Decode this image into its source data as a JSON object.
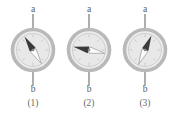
{
  "figure": {
    "background_color": "#ffffff",
    "width": 176,
    "height": 117
  },
  "style": {
    "ring_color": "#b9b9b9",
    "dial_face_color": "#e6e6e6",
    "dial_inner_ring_color": "#cfcfcf",
    "axis_line_color": "#9a9a9a",
    "needle_dark_color": "#3a3a3a",
    "needle_light_color": "#fbfbfb",
    "needle_light_stroke": "#9e9e9e",
    "pivot_color": "#8a8a8a",
    "text_color": "#5d5d5d",
    "caption_color": "#6a6a6a"
  },
  "panels": [
    {
      "id": "panel-1",
      "caption": "(1)",
      "axis_top_label": "a",
      "axis_bottom_label": "b",
      "center_x": 33,
      "center_y": 50,
      "outer_radius": 21,
      "inner_radius": 17,
      "needle_dark_bearing_deg": -32,
      "needle_light_bearing_deg": 148,
      "needle_dark_direction": "up-left (NNW)",
      "needle_light_direction": "down-right (SSE)"
    },
    {
      "id": "panel-2",
      "caption": "(2)",
      "axis_top_label": "a",
      "axis_bottom_label": "b",
      "center_x": 89,
      "center_y": 50,
      "outer_radius": 21,
      "inner_radius": 17,
      "needle_dark_bearing_deg": -78,
      "needle_light_bearing_deg": 102,
      "needle_dark_direction": "left (W, slightly up)",
      "needle_light_direction": "right (E, slightly down)"
    },
    {
      "id": "panel-3",
      "caption": "(3)",
      "axis_top_label": "a",
      "axis_bottom_label": "b",
      "center_x": 145,
      "center_y": 50,
      "outer_radius": 21,
      "inner_radius": 17,
      "needle_dark_bearing_deg": 24,
      "needle_light_bearing_deg": 204,
      "needle_dark_direction": "up-right (NNE)",
      "needle_light_direction": "down-left (SSW)"
    }
  ]
}
